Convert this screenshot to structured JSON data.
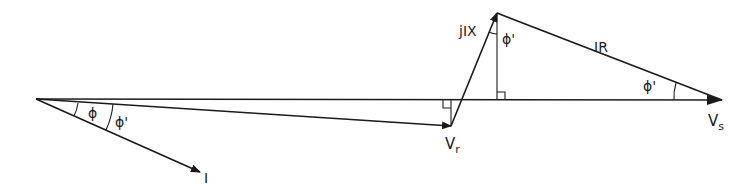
{
  "diagram": {
    "colors": {
      "line": "#1a1a1a",
      "background": "#ffffff"
    },
    "labels": {
      "current": "I",
      "phi": "ϕ",
      "phi_prime_left": "ϕ'",
      "phi_prime_top": "ϕ'",
      "phi_prime_right": "ϕ'",
      "jix": "jIX",
      "ir": "IR",
      "vr_main": "V",
      "vr_sub": "r",
      "vs_main": "V",
      "vs_sub": "s"
    },
    "points": {
      "origin": [
        36,
        99
      ],
      "vr_tip": [
        451,
        126
      ],
      "jix_tip": [
        497,
        13
      ],
      "vs_tip": [
        722,
        100
      ],
      "i_tip": [
        200,
        172
      ]
    }
  }
}
